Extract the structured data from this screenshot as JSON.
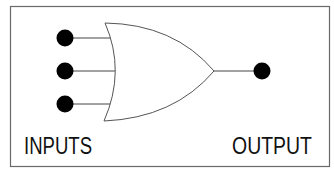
{
  "diagram": {
    "type": "OR logic gate",
    "labels": {
      "inputs": "INPUTS",
      "output": "OUTPUT"
    },
    "input_count": 3,
    "output_count": 1,
    "colors": {
      "frame": "#6a6a6a",
      "gate_outline": "#555555",
      "wire": "#444444",
      "terminal": "#000000",
      "text": "#111111",
      "background": "#ffffff"
    }
  }
}
